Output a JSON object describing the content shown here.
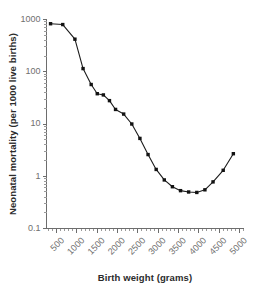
{
  "chart_data": {
    "type": "line",
    "title": "",
    "xlabel": "Birth weight (grams)",
    "ylabel": "Neonatal mortality (per 1000 live births)",
    "xlim": [
      250,
      5100
    ],
    "ylim": [
      0.1,
      1000
    ],
    "yscale": "log",
    "xscale": "linear",
    "grid": false,
    "legend": null,
    "xticks": [
      500,
      1000,
      1500,
      2000,
      2500,
      3000,
      3500,
      4000,
      4500,
      5000
    ],
    "xtick_labels": [
      "500",
      "1000",
      "1500",
      "2000",
      "2500",
      "3000",
      "3500",
      "4000",
      "4500",
      "5000"
    ],
    "yticks": [
      0.1,
      1,
      10,
      100,
      1000
    ],
    "ytick_labels": [
      "0.1",
      "1",
      "10",
      "100",
      "1000"
    ],
    "series": [
      {
        "name": "Neonatal mortality",
        "marker": "filled-square",
        "color": "#121212",
        "x": [
          350,
          650,
          950,
          1150,
          1350,
          1500,
          1650,
          1800,
          1950,
          2150,
          2350,
          2550,
          2750,
          2950,
          3150,
          3350,
          3550,
          3750,
          3950,
          4150,
          4350,
          4600,
          4850
        ],
        "y": [
          830,
          800,
          420,
          115,
          57,
          38,
          36,
          28,
          19,
          15.5,
          10,
          5.3,
          2.6,
          1.35,
          0.85,
          0.63,
          0.53,
          0.5,
          0.49,
          0.55,
          0.78,
          1.3,
          2.7
        ]
      }
    ]
  },
  "axes": {
    "x_title": "Birth weight (grams)",
    "y_title": "Neonatal mortality (per 1000 live births)"
  }
}
